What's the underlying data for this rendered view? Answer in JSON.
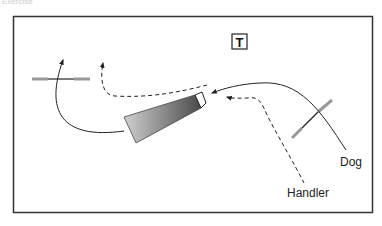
{
  "caption": "Exercise",
  "diagram": {
    "title_marker": "T",
    "labels": {
      "dog": "Dog",
      "handler": "Handler"
    },
    "colors": {
      "frame": "#333333",
      "line": "#222222",
      "pole": "#999999",
      "tunnel_dark": "#555555",
      "tunnel_light": "#cccccc"
    },
    "elements": [
      "jump-left",
      "jump-right",
      "tunnel",
      "dog-path",
      "handler-path",
      "handler-path-secondary"
    ]
  }
}
